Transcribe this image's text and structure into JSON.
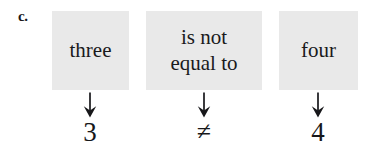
{
  "figure": {
    "item_label": "c.",
    "background_color": "#ffffff",
    "box_fill_color": "#e9e9e9",
    "text_color": "#17171a"
  },
  "columns": [
    {
      "phrase": "three",
      "arrow": "down-arrow",
      "symbol": "3"
    },
    {
      "phrase": "is not\nequal to",
      "arrow": "down-arrow",
      "symbol": "≠"
    },
    {
      "phrase": "four",
      "arrow": "down-arrow",
      "symbol": "4"
    }
  ]
}
